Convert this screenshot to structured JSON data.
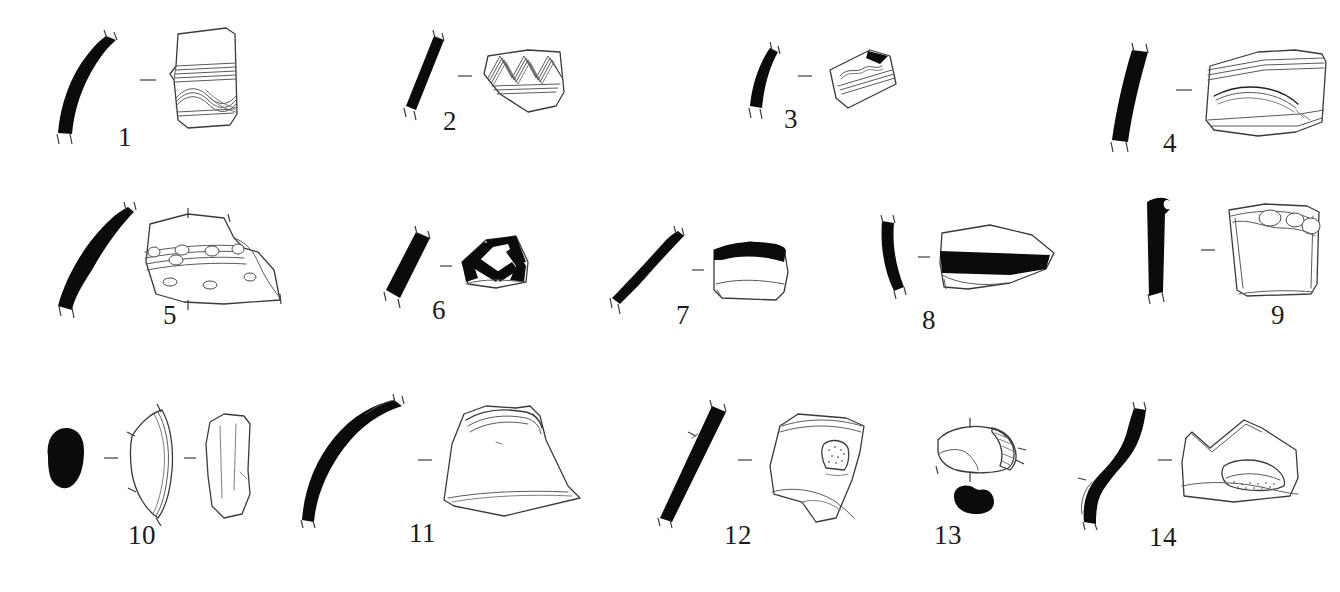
{
  "plate": {
    "title": "Archaeological pottery sherd illustration plate",
    "figure_type": "line-drawing-plate",
    "width": 1340,
    "height": 592,
    "background_color": "#ffffff",
    "ink_color": "#0b0b0b",
    "outline_color": "#3a3a3a",
    "rows": 3,
    "item_count": 14,
    "separator_glyph": "–"
  },
  "items": [
    {
      "number": "1",
      "row": 1,
      "label_x": 122,
      "label_y": 132,
      "parts": [
        "profile-section",
        "separator-dash",
        "sherd-drawing"
      ],
      "profile": "curved vertical rim profile, solid black fill",
      "sherd": "rim sherd with horizontal combed bands and interlocking wavy line band",
      "decoration": "horizontal grooved bands + wavy combed line"
    },
    {
      "number": "2",
      "row": 1,
      "label_x": 443,
      "label_y": 113,
      "parts": [
        "profile-section",
        "separator-dash",
        "sherd-drawing"
      ],
      "profile": "straight diagonal wall profile, solid black fill",
      "sherd": "body sherd with bold zigzag wave combed decoration",
      "decoration": "multi-tooth comb wave / zigzag with horizontal lines beneath"
    },
    {
      "number": "3",
      "row": 1,
      "label_x": 784,
      "label_y": 110,
      "parts": [
        "profile-section",
        "separator-dash",
        "sherd-drawing"
      ],
      "profile": "narrow tapering profile, solid black fill",
      "sherd": "small tilted sherd with wavy line over horizontal bands",
      "decoration": "single wavy line above grooved horizontal bands"
    },
    {
      "number": "4",
      "row": 1,
      "label_x": 1163,
      "label_y": 135,
      "parts": [
        "profile-section",
        "separator-dash",
        "sherd-drawing"
      ],
      "profile": "thick straight wall profile, solid black fill",
      "sherd": "large rectangular sherd with horizontal bands and a curved arc",
      "decoration": "horizontal grooved bands at top, curved incised arc below"
    },
    {
      "number": "5",
      "row": 2,
      "label_x": 163,
      "label_y": 318,
      "parts": [
        "profile-section",
        "separator-dash",
        "sherd-drawing"
      ],
      "profile": "long curved wall profile, solid black fill",
      "sherd": "large sherd with banded cordon bearing oval impressions and scattered dots",
      "decoration": "horizontal cordon with oval bosses, impressed ovals below"
    },
    {
      "number": "6",
      "row": 2,
      "label_x": 432,
      "label_y": 305,
      "parts": [
        "profile-section",
        "separator-dash",
        "sherd-drawing"
      ],
      "profile": "straight diagonal profile, solid black fill",
      "sherd": "sherd with bold black painted lattice / crossing bands",
      "decoration": "thick black painted cross-hatch lattice"
    },
    {
      "number": "7",
      "row": 2,
      "label_x": 676,
      "label_y": 310,
      "parts": [
        "profile-section",
        "separator-dash",
        "sherd-drawing"
      ],
      "profile": "gently curved wall profile, solid black fill",
      "sherd": "sherd with solid black painted band along the upper rim",
      "decoration": "broad black rim band"
    },
    {
      "number": "8",
      "row": 2,
      "label_x": 922,
      "label_y": 318,
      "parts": [
        "profile-section",
        "separator-dash",
        "sherd-drawing"
      ],
      "profile": "curved rim profile, solid black fill",
      "sherd": "pointed sherd crossed by a thick horizontal black painted band",
      "decoration": "broad horizontal black band"
    },
    {
      "number": "9",
      "row": 2,
      "label_x": 1186,
      "label_y": 312,
      "parts": [
        "profile-section",
        "separator-dash",
        "sherd-drawing"
      ],
      "profile": "straight profile with thickened rounded rim, solid black fill",
      "sherd": "plain sherd with rounded bosses along the upper edge",
      "decoration": "row of rounded bosses / impressions at the rim"
    },
    {
      "number": "10",
      "row": 3,
      "label_x": 128,
      "label_y": 535,
      "parts": [
        "handle-section",
        "separator-dash",
        "handle-profile",
        "separator-dash",
        "handle-face"
      ],
      "profile": "solid black oval handle cross-section",
      "sherd": "curved handle profile and plain elongated handle face view",
      "decoration": "plain, undecorated"
    },
    {
      "number": "11",
      "row": 3,
      "label_x": 409,
      "label_y": 533,
      "parts": [
        "profile-section",
        "separator-dash",
        "sherd-drawing"
      ],
      "profile": "strongly curved everted rim profile, solid black fill",
      "sherd": "large trapezoidal sherd with flaring neck and rim",
      "decoration": "plain with faint horizontal lines"
    },
    {
      "number": "12",
      "row": 3,
      "label_x": 724,
      "label_y": 533,
      "parts": [
        "profile-section",
        "separator-dash",
        "sherd-drawing"
      ],
      "profile": "straight diagonal wall profile, solid black fill",
      "sherd": "tilted sherd with a small applied knob / lug",
      "decoration": "applied stippled knob, horizontal lines at top"
    },
    {
      "number": "13",
      "row": 3,
      "label_x": 948,
      "label_y": 535,
      "parts": [
        "lug-plan-view",
        "lug-section"
      ],
      "profile": "solid black lug cross-section blob",
      "sherd": "horizontal lug / handle shown in plan with hatched end",
      "decoration": "hatched break surface"
    },
    {
      "number": "14",
      "row": 3,
      "label_x": 1149,
      "label_y": 533,
      "parts": [
        "profile-section",
        "separator-dash",
        "sherd-drawing"
      ],
      "profile": "S-curved wall profile, solid black fill",
      "sherd": "irregular angular sherd with stippled crescent area near base",
      "decoration": "stippled / hatched applied crescent band"
    }
  ]
}
